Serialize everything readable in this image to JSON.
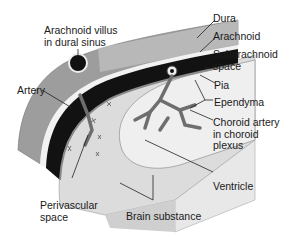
{
  "diagram": {
    "labels": {
      "dura": "Dura",
      "arachnoid": "Arachnoid",
      "subarachnoid_1": "Subarachnoid",
      "subarachnoid_2": "space",
      "pia": "Pia",
      "ependyma": "Ependyma",
      "choroid_1": "Choroid artery",
      "choroid_2": "in choroid",
      "choroid_3": "plexus",
      "ventricle": "Ventricle",
      "brain": "Brain substance",
      "perivascular_1": "Perivascular",
      "perivascular_2": "space",
      "artery": "Artery",
      "villus_1": "Arachnoid villus",
      "villus_2": "in dural sinus"
    },
    "colors": {
      "dura": "#9a9a9a",
      "dura_light": "#c8c8c8",
      "subarachnoid": "#111111",
      "brain": "#d9d9d9",
      "ventricle": "#ececec",
      "vessel": "#6e6e6e",
      "line": "#222222"
    }
  }
}
